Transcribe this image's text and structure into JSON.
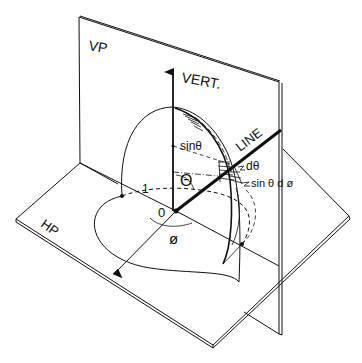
{
  "figure": {
    "colors": {
      "ink": "#111111",
      "background": "#ffffff"
    }
  },
  "labels": {
    "vertical_plane": "VP",
    "horizontal_plane": "HP",
    "vertical_axis": "VERT.",
    "line": "LINE",
    "sin_theta": "sinθ",
    "theta": "Θ",
    "d_theta": "dθ",
    "sin_theta_d_phi": "sin θ d ø",
    "phi": "ø",
    "unit_radius": "1",
    "origin": "0"
  }
}
